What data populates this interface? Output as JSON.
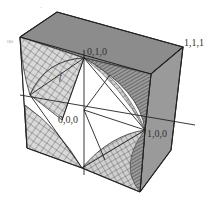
{
  "figure": {
    "type": "3d-unit-cube-diagram",
    "colors": {
      "face_shade": "#8c8c8c",
      "face_shade_right": "#9a9a9a",
      "surface_light": "#d4d4d4",
      "edge": "#222222",
      "background": "#ffffff"
    },
    "labels": {
      "corner_010": "0,1,0",
      "corner_111": "1,1,1",
      "corner_000": "0,0,0",
      "corner_100": "1,0,0",
      "function_label": "f",
      "left_mark": "oo",
      "top_mark": "·"
    }
  }
}
